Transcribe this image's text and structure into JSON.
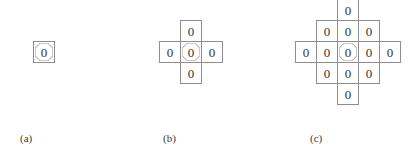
{
  "page": {
    "background_color": "#ffffff",
    "cell_border_color": "#8d8d8d",
    "text_color": "#333333",
    "cell_size_px": 22,
    "digit": "0"
  },
  "figures": [
    {
      "id": "a",
      "caption": "(a)",
      "caption_x": 20,
      "caption_y": 133,
      "description": "von Neumann neighborhood of range 0 — a single origin cell",
      "cell_count": 1,
      "origin_x": 33,
      "origin_y": 41,
      "cells": [
        {
          "name": "origin-cell",
          "col": 0,
          "row": 0,
          "value": "0",
          "origin": true
        }
      ]
    },
    {
      "id": "b",
      "caption": "(b)",
      "caption_x": 163,
      "caption_y": 133,
      "description": "von Neumann neighborhood of range 1 — plus shape of 5 cells",
      "cell_count": 5,
      "origin_x": 180,
      "origin_y": 41,
      "cells": [
        {
          "name": "cell-north",
          "col": 0,
          "row": -1,
          "value": "0",
          "origin": false
        },
        {
          "name": "cell-west",
          "col": -1,
          "row": 0,
          "value": "0",
          "origin": false
        },
        {
          "name": "origin-cell",
          "col": 0,
          "row": 0,
          "value": "0",
          "origin": true
        },
        {
          "name": "cell-east",
          "col": 1,
          "row": 0,
          "value": "0",
          "origin": false
        },
        {
          "name": "cell-south",
          "col": 0,
          "row": 1,
          "value": "0",
          "origin": false
        }
      ]
    },
    {
      "id": "c",
      "caption": "(c)",
      "caption_x": 310,
      "caption_y": 133,
      "description": "von Neumann neighborhood of range 2 — diamond of 13 cells",
      "cell_count": 13,
      "origin_x": 337,
      "origin_y": 41,
      "cells": [
        {
          "name": "cell-north-2",
          "col": 0,
          "row": -2,
          "value": "0",
          "origin": false
        },
        {
          "name": "cell-north-west",
          "col": -1,
          "row": -1,
          "value": "0",
          "origin": false
        },
        {
          "name": "cell-north",
          "col": 0,
          "row": -1,
          "value": "0",
          "origin": false
        },
        {
          "name": "cell-north-east",
          "col": 1,
          "row": -1,
          "value": "0",
          "origin": false
        },
        {
          "name": "cell-west-2",
          "col": -2,
          "row": 0,
          "value": "0",
          "origin": false
        },
        {
          "name": "cell-west",
          "col": -1,
          "row": 0,
          "value": "0",
          "origin": false
        },
        {
          "name": "origin-cell",
          "col": 0,
          "row": 0,
          "value": "0",
          "origin": true
        },
        {
          "name": "cell-east",
          "col": 1,
          "row": 0,
          "value": "0",
          "origin": false
        },
        {
          "name": "cell-east-2",
          "col": 2,
          "row": 0,
          "value": "0",
          "origin": false
        },
        {
          "name": "cell-south-west",
          "col": -1,
          "row": 1,
          "value": "0",
          "origin": false
        },
        {
          "name": "cell-south",
          "col": 0,
          "row": 1,
          "value": "0",
          "origin": false
        },
        {
          "name": "cell-south-east",
          "col": 1,
          "row": 1,
          "value": "0",
          "origin": false
        },
        {
          "name": "cell-south-2",
          "col": 0,
          "row": 2,
          "value": "0",
          "origin": false
        }
      ]
    }
  ]
}
